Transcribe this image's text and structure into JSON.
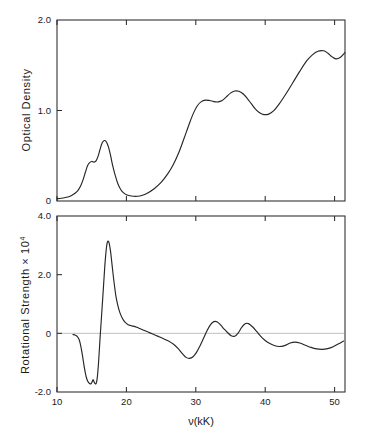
{
  "figure": {
    "background": "#ffffff",
    "ink_color": "#262626",
    "zero_line_color": "#b9b9b9"
  },
  "chart_data": [
    {
      "type": "line",
      "panel": "top",
      "title": "",
      "xlabel": "",
      "ylabel": "Optical Density",
      "xlim": [
        10,
        51.5
      ],
      "ylim": [
        0,
        2.0
      ],
      "xticks": [
        10,
        20,
        30,
        40,
        50
      ],
      "xticklabels": [
        "10",
        "20",
        "30",
        "40",
        "50"
      ],
      "yticks": [
        0,
        1.0,
        2.0
      ],
      "yticklabels": [
        "0",
        "1.0",
        "2.0"
      ],
      "grid": false,
      "legend": "none",
      "series": [
        {
          "name": "Optical Density",
          "x": [
            10.0,
            10.6,
            11.2,
            11.8,
            12.2,
            12.6,
            13.0,
            13.4,
            13.8,
            14.1,
            14.4,
            14.7,
            15.0,
            15.3,
            15.6,
            15.9,
            16.2,
            16.5,
            16.8,
            17.1,
            17.4,
            17.7,
            18.0,
            18.4,
            18.8,
            19.2,
            19.6,
            20.0,
            20.5,
            21.0,
            21.6,
            22.2,
            23.0,
            24.0,
            25.0,
            26.0,
            26.8,
            27.6,
            28.3,
            29.0,
            29.6,
            30.2,
            30.8,
            31.4,
            32.0,
            32.6,
            33.2,
            33.8,
            34.4,
            35.0,
            35.6,
            36.2,
            36.8,
            37.4,
            38.0,
            38.6,
            39.2,
            39.8,
            40.5,
            41.2,
            42.0,
            43.0,
            44.0,
            45.0,
            46.0,
            46.8,
            47.6,
            48.4,
            49.0,
            49.6,
            50.2,
            50.8,
            51.5
          ],
          "y": [
            0.025,
            0.03,
            0.038,
            0.05,
            0.065,
            0.085,
            0.115,
            0.165,
            0.245,
            0.32,
            0.39,
            0.425,
            0.437,
            0.43,
            0.44,
            0.49,
            0.57,
            0.64,
            0.668,
            0.655,
            0.6,
            0.51,
            0.4,
            0.28,
            0.185,
            0.125,
            0.09,
            0.07,
            0.058,
            0.052,
            0.052,
            0.06,
            0.085,
            0.135,
            0.205,
            0.305,
            0.41,
            0.545,
            0.69,
            0.84,
            0.96,
            1.05,
            1.098,
            1.115,
            1.11,
            1.098,
            1.095,
            1.11,
            1.15,
            1.192,
            1.215,
            1.212,
            1.185,
            1.135,
            1.075,
            1.015,
            0.975,
            0.955,
            0.96,
            0.995,
            1.07,
            1.185,
            1.31,
            1.435,
            1.55,
            1.615,
            1.655,
            1.66,
            1.635,
            1.595,
            1.57,
            1.585,
            1.64
          ]
        }
      ]
    },
    {
      "type": "line",
      "panel": "bottom",
      "title": "",
      "xlabel": "ν(kK)",
      "ylabel": "Rotational Strength × 10",
      "ylabel_exponent": "4",
      "xlim": [
        10,
        51.5
      ],
      "ylim": [
        -2.0,
        4.0
      ],
      "xticks": [
        10,
        20,
        30,
        40,
        50
      ],
      "xticklabels": [
        "10",
        "20",
        "30",
        "40",
        "50"
      ],
      "yticks": [
        -2.0,
        0,
        2.0,
        4.0
      ],
      "yticklabels": [
        "-2.0",
        "0",
        "2.0",
        "4.0"
      ],
      "grid": false,
      "zero_line": true,
      "legend": "none",
      "series": [
        {
          "name": "Rotational Strength",
          "x": [
            12.3,
            12.6,
            12.9,
            13.2,
            13.45,
            13.7,
            13.95,
            14.2,
            14.45,
            14.7,
            14.9,
            15.05,
            15.2,
            15.35,
            15.5,
            15.65,
            15.8,
            16.0,
            16.2,
            16.45,
            16.7,
            16.95,
            17.2,
            17.45,
            17.7,
            17.95,
            18.2,
            18.5,
            18.8,
            19.1,
            19.45,
            19.8,
            20.2,
            20.6,
            21.0,
            21.5,
            22.0,
            22.6,
            23.2,
            23.8,
            24.5,
            25.2,
            26.0,
            26.8,
            27.5,
            28.1,
            28.6,
            29.1,
            29.6,
            30.1,
            30.6,
            31.1,
            31.6,
            32.1,
            32.6,
            33.1,
            33.6,
            34.1,
            34.6,
            35.1,
            35.6,
            36.1,
            36.6,
            37.1,
            37.6,
            38.2,
            38.8,
            39.4,
            40.0,
            40.6,
            41.3,
            42.0,
            42.8,
            43.6,
            44.3,
            45.0,
            45.8,
            46.6,
            47.4,
            48.2,
            49.0,
            49.8,
            50.6,
            51.3
          ],
          "y": [
            -0.04,
            -0.06,
            -0.1,
            -0.22,
            -0.46,
            -0.8,
            -1.18,
            -1.48,
            -1.64,
            -1.71,
            -1.72,
            -1.66,
            -1.58,
            -1.66,
            -1.72,
            -1.7,
            -1.52,
            -0.95,
            -0.18,
            0.7,
            1.6,
            2.48,
            3.05,
            3.12,
            2.82,
            2.3,
            1.78,
            1.25,
            0.92,
            0.68,
            0.5,
            0.38,
            0.3,
            0.265,
            0.245,
            0.205,
            0.155,
            0.095,
            0.035,
            -0.025,
            -0.095,
            -0.165,
            -0.255,
            -0.375,
            -0.53,
            -0.7,
            -0.82,
            -0.855,
            -0.8,
            -0.65,
            -0.43,
            -0.18,
            0.08,
            0.29,
            0.4,
            0.39,
            0.28,
            0.14,
            0.02,
            -0.08,
            -0.1,
            0.01,
            0.2,
            0.33,
            0.33,
            0.215,
            0.055,
            -0.11,
            -0.245,
            -0.34,
            -0.415,
            -0.45,
            -0.42,
            -0.33,
            -0.3,
            -0.33,
            -0.405,
            -0.48,
            -0.53,
            -0.545,
            -0.52,
            -0.455,
            -0.355,
            -0.265
          ]
        }
      ]
    }
  ]
}
